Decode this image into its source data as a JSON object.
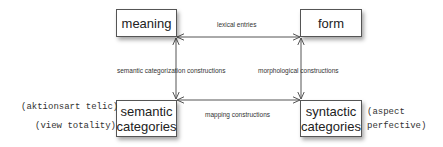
{
  "diagram": {
    "nodes": [
      {
        "id": "meaning",
        "label": "meaning"
      },
      {
        "id": "form",
        "label": "form"
      },
      {
        "id": "semantic_categories",
        "label": "semantic\ncategories"
      },
      {
        "id": "syntactic_categories",
        "label": "syntactic\ncategories"
      }
    ],
    "edges": [
      {
        "id": "lexical",
        "from": "meaning",
        "to": "form",
        "label": "lexical entries",
        "bidirectional": true
      },
      {
        "id": "semcat",
        "from": "meaning",
        "to": "semantic_categories",
        "label": "semantic categorization constructions",
        "bidirectional": true
      },
      {
        "id": "morph",
        "from": "form",
        "to": "syntactic_categories",
        "label": "morphological constructions",
        "bidirectional": true
      },
      {
        "id": "mapping",
        "from": "semantic_categories",
        "to": "syntactic_categories",
        "label": "mapping constructions",
        "bidirectional": true
      }
    ],
    "annotations": {
      "semantic_left_1": "(aktionsart telic)",
      "semantic_left_2": "(view totality)",
      "syntactic_right_1": "(aspect",
      "syntactic_right_2": "perfective)"
    },
    "colors": {
      "line": "#555555",
      "text": "#222222",
      "background": "#ffffff"
    }
  }
}
